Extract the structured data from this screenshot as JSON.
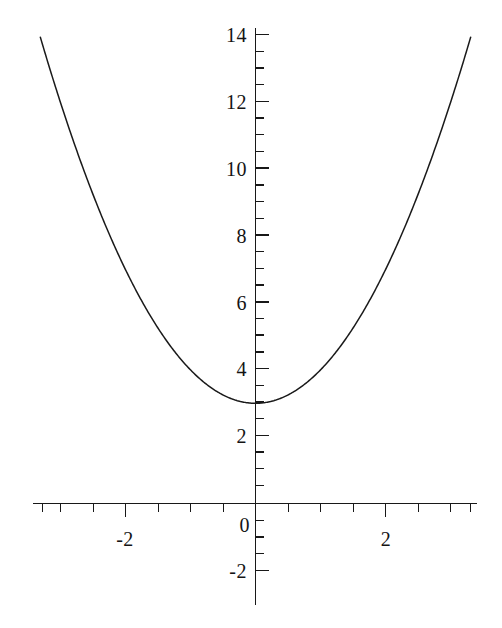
{
  "chart_data": {
    "type": "line",
    "title": "",
    "subtitle": "",
    "xlabel": "",
    "ylabel": "",
    "equation": "y = x^2 + 3",
    "xlim": [
      -3.35,
      3.35
    ],
    "ylim": [
      -2.6,
      14.6
    ],
    "grid": false,
    "legend": null,
    "background_color": "#ffffff",
    "curve_color": "#1a1a1a",
    "axis_color": "#181818",
    "x_major_ticks": [
      -2,
      0,
      2
    ],
    "x_major_tick_labels": [
      "-2",
      "0",
      "2"
    ],
    "x_minor_tick_step": 0.5,
    "y_major_ticks": [
      -2,
      2,
      4,
      6,
      8,
      10,
      12,
      14
    ],
    "y_major_tick_labels": [
      "-2",
      "2",
      "4",
      "6",
      "8",
      "10",
      "12",
      "14"
    ],
    "y_minor_tick_step": 0.5,
    "origin_label": "0",
    "vertex": [
      0,
      3
    ],
    "series": [
      {
        "name": "y = x^2 + 3",
        "x": [
          -3.31,
          -3.1,
          -2.9,
          -2.7,
          -2.5,
          -2.3,
          -2.1,
          -1.9,
          -1.7,
          -1.5,
          -1.3,
          -1.1,
          -0.9,
          -0.7,
          -0.5,
          -0.3,
          -0.1,
          0,
          0.1,
          0.3,
          0.5,
          0.7,
          0.9,
          1.1,
          1.3,
          1.5,
          1.7,
          1.9,
          2.1,
          2.3,
          2.5,
          2.7,
          2.9,
          3.1,
          3.31
        ],
        "y": [
          13.96,
          12.61,
          11.41,
          10.29,
          9.25,
          8.29,
          7.41,
          6.61,
          5.89,
          5.25,
          4.69,
          4.21,
          3.81,
          3.49,
          3.25,
          3.09,
          3.01,
          3.0,
          3.01,
          3.09,
          3.25,
          3.49,
          3.81,
          4.21,
          4.69,
          5.25,
          5.89,
          6.61,
          7.41,
          8.29,
          9.25,
          10.29,
          11.41,
          12.61,
          13.96
        ]
      }
    ]
  },
  "labels": {
    "y14": "14",
    "y12": "12",
    "y10": "10",
    "y8": "8",
    "y6": "6",
    "y4": "4",
    "y2": "2",
    "ym2": "-2",
    "xm2": "-2",
    "x0": "0",
    "x2": "2"
  }
}
